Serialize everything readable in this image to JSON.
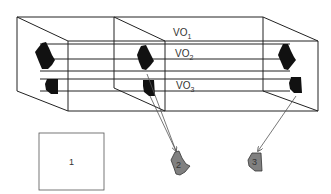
{
  "diagram": {
    "layers": [
      {
        "label": "VO",
        "sub": "1"
      },
      {
        "label": "VO",
        "sub": "2"
      },
      {
        "label": "VO",
        "sub": "3"
      }
    ],
    "output_objects": [
      {
        "label": "1",
        "shape": "square"
      },
      {
        "label": "2",
        "shape": "blob"
      },
      {
        "label": "3",
        "shape": "blob"
      }
    ],
    "colors": {
      "line": "#222222",
      "object_fill": "#111111",
      "output_fill": "#808080",
      "arrow": "#555555"
    }
  }
}
